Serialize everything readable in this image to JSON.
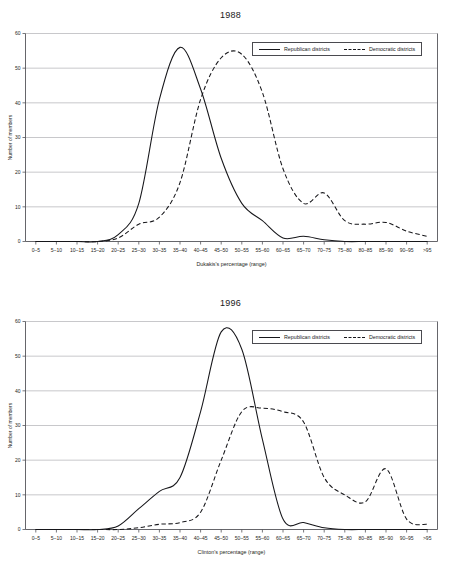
{
  "figures": [
    {
      "id": "1988",
      "title": "1988",
      "xlabel": "Dukakis's percentage (range)",
      "ylabel": "Number of members",
      "legend": {
        "republican": "Republican districts",
        "democratic": "Democratic districts"
      }
    },
    {
      "id": "1996",
      "title": "1996",
      "xlabel": "Clinton's percentage (range)",
      "ylabel": "Number of members",
      "legend": {
        "republican": "Republican districts",
        "democratic": "Democratic districts"
      }
    }
  ],
  "chart_data": [
    {
      "type": "line",
      "title": "1988",
      "xlabel": "Dukakis's percentage (range)",
      "ylabel": "Number of members",
      "ylim": [
        0,
        60
      ],
      "yticks": [
        0,
        10,
        20,
        30,
        40,
        50,
        60
      ],
      "grid": true,
      "legend_position": "top-right",
      "categories": [
        "0–5",
        "5–10",
        "10–15",
        "15–20",
        "20–25",
        "25–30",
        "30–35",
        "35–40",
        "40–45",
        "45–50",
        "50–55",
        "55–60",
        "60–65",
        "65–70",
        "70–75",
        "75–80",
        "80–85",
        "85–90",
        "90–95",
        ">95"
      ],
      "series": [
        {
          "name": "Republican districts",
          "style": "solid",
          "values": [
            0,
            0,
            0,
            0,
            2,
            11,
            41,
            56,
            44,
            24,
            11,
            6,
            1,
            1.5,
            0.5,
            0,
            0,
            0,
            0,
            0
          ]
        },
        {
          "name": "Democratic districts",
          "style": "dashed",
          "values": [
            0,
            0,
            0,
            0,
            1,
            5,
            7,
            17,
            41,
            53,
            54,
            43,
            21,
            11,
            14,
            6,
            5,
            5.5,
            3,
            1.5
          ]
        }
      ]
    },
    {
      "type": "line",
      "title": "1996",
      "xlabel": "Clinton's percentage (range)",
      "ylabel": "Number of members",
      "ylim": [
        0,
        60
      ],
      "yticks": [
        0,
        10,
        20,
        30,
        40,
        50,
        60
      ],
      "grid": true,
      "legend_position": "top-right",
      "categories": [
        "0–5",
        "5–10",
        "10–15",
        "15–20",
        "20–25",
        "25–30",
        "30–35",
        "35–40",
        "40–45",
        "45–50",
        "50–55",
        "55–60",
        "60–65",
        "65–70",
        "70–75",
        "75–80",
        "80–85",
        "85–90",
        "90–95",
        ">95"
      ],
      "series": [
        {
          "name": "Republican districts",
          "style": "solid",
          "values": [
            0,
            0,
            0,
            0,
            1,
            6,
            11,
            15,
            34,
            57,
            52,
            26,
            3,
            2,
            0.5,
            0,
            0,
            0,
            0,
            0
          ]
        },
        {
          "name": "Democratic districts",
          "style": "dashed",
          "values": [
            0,
            0,
            0,
            0,
            0,
            0.5,
            1.5,
            2,
            5,
            20,
            34,
            35,
            34,
            31,
            15,
            10,
            8,
            17.5,
            3,
            1.5
          ]
        }
      ]
    }
  ]
}
